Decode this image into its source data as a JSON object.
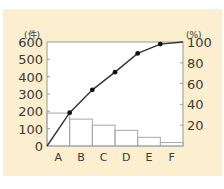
{
  "chart_data": {
    "type": "bar",
    "subtype": "pareto",
    "title": "",
    "xlabel": "",
    "ylabel": "(件)",
    "y2label": "(%)",
    "categories": [
      "A",
      "B",
      "C",
      "D",
      "E",
      "F"
    ],
    "series": [
      {
        "name": "件数",
        "type": "bar",
        "axis": "left",
        "values": [
          190,
          155,
          120,
          90,
          50,
          20
        ]
      },
      {
        "name": "累積比率",
        "type": "line",
        "axis": "right",
        "values": [
          32,
          54,
          71,
          89,
          98,
          100
        ]
      }
    ],
    "ylim": [
      0,
      600
    ],
    "y2lim": [
      0,
      100
    ],
    "yticks": [
      0,
      100,
      200,
      300,
      400,
      500,
      600
    ],
    "y2ticks": [
      20,
      40,
      60,
      80,
      100
    ],
    "grid": false,
    "legend": "none"
  },
  "axis": {
    "left_unit": "(件)",
    "right_unit": "(%)",
    "left_ticks": [
      "0",
      "100",
      "200",
      "300",
      "400",
      "500",
      "600"
    ],
    "right_ticks": [
      "20",
      "40",
      "60",
      "80",
      "100"
    ]
  },
  "colors": {
    "panel_bg": "#fbefcf",
    "plot_bg": "#ffffff",
    "axis": "#9a9a9a",
    "bar_stroke": "#a8a8a8",
    "line": "#333333",
    "marker": "#111111"
  }
}
